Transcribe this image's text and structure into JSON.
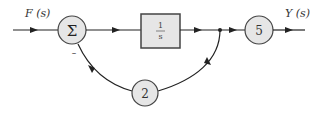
{
  "diagram": {
    "type": "block-diagram",
    "input_label": "F (s)",
    "output_label": "Y (s)",
    "summing_junction": {
      "symbol": "Σ",
      "feedback_sign": "–"
    },
    "forward_block": {
      "numerator": "1",
      "denominator": "s"
    },
    "output_gain": {
      "value": "5"
    },
    "feedback_gain": {
      "value": "2"
    },
    "colors": {
      "line": "#222222",
      "block_fill": "#e6e6e6",
      "block_stroke": "#444444"
    }
  }
}
